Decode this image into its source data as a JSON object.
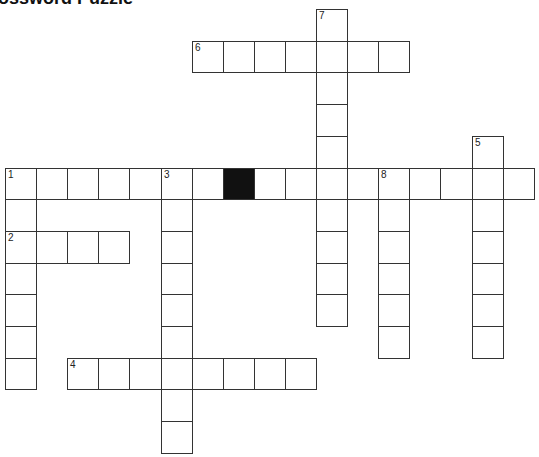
{
  "title": "Crossword Puzzle",
  "grid": {
    "origin_x": 5,
    "origin_y": 9,
    "cell_w": 31.1,
    "cell_h": 31.7,
    "cols": 17,
    "rows": 14
  },
  "clues": {
    "across": [
      {
        "number": "1",
        "row": 5,
        "col": 0,
        "length": 17
      },
      {
        "number": "2",
        "row": 7,
        "col": 0,
        "length": 4
      },
      {
        "number": "4",
        "row": 11,
        "col": 2,
        "length": 8
      },
      {
        "number": "6",
        "row": 1,
        "col": 6,
        "length": 7
      }
    ],
    "down": [
      {
        "number": "1",
        "row": 5,
        "col": 0,
        "length": 7
      },
      {
        "number": "3",
        "row": 5,
        "col": 5,
        "length": 9
      },
      {
        "number": "5",
        "row": 4,
        "col": 15,
        "length": 7
      },
      {
        "number": "7",
        "row": 0,
        "col": 10,
        "length": 10
      },
      {
        "number": "8",
        "row": 5,
        "col": 12,
        "length": 6
      }
    ]
  },
  "black_cells": [
    [
      5,
      7
    ]
  ],
  "colors": {
    "border": "#333333",
    "black": "#111111",
    "background": "#ffffff"
  }
}
